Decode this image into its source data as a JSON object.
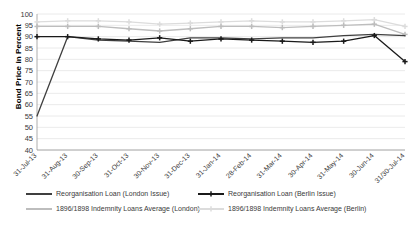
{
  "chart_data": {
    "type": "line",
    "title": "",
    "xlabel": "",
    "ylabel": "Bond Price in Percent",
    "ylim": [
      40,
      100
    ],
    "ytick_step": 5,
    "yticks": [
      100,
      95,
      90,
      85,
      80,
      75,
      70,
      65,
      60,
      55,
      50,
      45,
      40
    ],
    "grid": true,
    "legend_position": "bottom",
    "categories": [
      "31-Jul-13",
      "31-Aug-13",
      "30-Sep-13",
      "31-Oct-13",
      "30-Nov-13",
      "31-Dec-13",
      "31-Jan-14",
      "28-Feb-14",
      "31-Mar-14",
      "30-Apr-14",
      "31-May-14",
      "30-Jun-14",
      "31/30-Jul-14"
    ],
    "series": [
      {
        "name": "Reorganisation Loan (London Issue)",
        "color": "#3f3f3f",
        "marker": "none",
        "values": [
          55.0,
          90.0,
          88.5,
          88.0,
          87.5,
          89.5,
          89.5,
          89.0,
          89.5,
          89.5,
          90.5,
          91.0,
          90.5
        ]
      },
      {
        "name": "Reorganisation Loan (Berlin Issue)",
        "color": "#1a1a1a",
        "marker": "cross",
        "values": [
          90.0,
          90.0,
          89.0,
          88.5,
          89.5,
          88.0,
          89.0,
          88.5,
          88.0,
          87.5,
          88.0,
          90.5,
          79.0
        ]
      },
      {
        "name": "1896/1898 Indemnity Loans Average (London)",
        "color": "#bdbdbd",
        "marker": "cross",
        "values": [
          94.5,
          94.5,
          94.5,
          93.5,
          92.5,
          93.5,
          94.5,
          94.5,
          94.0,
          94.5,
          95.0,
          95.5,
          91.0
        ]
      },
      {
        "name": "1896/1898 Indemnity Loans Average (Berlin)",
        "color": "#dcdcdc",
        "marker": "cross",
        "values": [
          96.5,
          97.0,
          97.0,
          96.5,
          95.5,
          96.0,
          96.5,
          97.0,
          96.5,
          96.5,
          97.0,
          97.5,
          94.5
        ]
      }
    ]
  },
  "legend": {
    "items": [
      {
        "label": "Reorganisation Loan (London Issue)",
        "color": "#3f3f3f",
        "marker": "none"
      },
      {
        "label": "Reorganisation Loan (Berlin Issue)",
        "color": "#1a1a1a",
        "marker": "cross"
      },
      {
        "label": "1896/1898 Indemnity Loans Average (London)",
        "color": "#bdbdbd",
        "marker": "none"
      },
      {
        "label": "1896/1898 Indemnity Loans Average (Berlin)",
        "color": "#dcdcdc",
        "marker": "cross"
      }
    ]
  },
  "axis": {
    "y_title": "Bond Price in Percent"
  }
}
